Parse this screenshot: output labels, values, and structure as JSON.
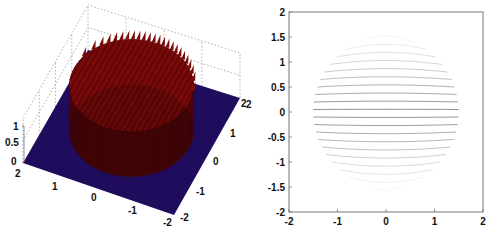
{
  "chart_data": [
    {
      "type": "surface",
      "title": "",
      "description": "3D surface plot of a disc-shaped indicator function (height 1 inside radius ~1.5, 0 outside) over x,y in [-2,2], with comb-like ridges along the top",
      "xlabel": "",
      "ylabel": "",
      "zlabel": "",
      "x_ticks": [
        "2",
        "1",
        "0",
        "-1",
        "-2"
      ],
      "y_ticks": [
        "2",
        "1",
        "0",
        "-1",
        "-2"
      ],
      "z_ticks": [
        "0",
        "0.5",
        "1"
      ],
      "xlim": [
        -2,
        2
      ],
      "ylim": [
        -2,
        2
      ],
      "zlim": [
        0,
        1
      ],
      "disc_radius": 1.5,
      "disc_height": 1,
      "grid": true,
      "colors": {
        "floor": "#1f0c5c",
        "disc": "#7a0a0a",
        "disc_dark": "#3a0404",
        "grid": "#9a9a9a"
      }
    },
    {
      "type": "line",
      "title": "",
      "description": "Top view: family of horizontal arcs inside a circle of radius ~1.5, bowing upward above y=0 and downward below, fading toward top and bottom",
      "xlabel": "",
      "ylabel": "",
      "x_ticks": [
        "-2",
        "-1",
        "0",
        "1",
        "2"
      ],
      "y_ticks": [
        "2",
        "1.5",
        "1",
        "0.5",
        "0",
        "-0.5",
        "-1",
        "-1.5",
        "-2"
      ],
      "xlim": [
        -2,
        2
      ],
      "ylim": [
        -2,
        2
      ],
      "grid": false,
      "circle_radius": 1.5,
      "line_count": 19,
      "line_y_levels": [
        -1.45,
        -1.3,
        -1.15,
        -1.0,
        -0.85,
        -0.7,
        -0.55,
        -0.4,
        -0.25,
        -0.1,
        0.05,
        0.2,
        0.35,
        0.5,
        0.65,
        0.8,
        0.95,
        1.1,
        1.25,
        1.4
      ],
      "colors": {
        "line": "#555555",
        "axis": "#777777"
      }
    }
  ],
  "stray_label": "2"
}
